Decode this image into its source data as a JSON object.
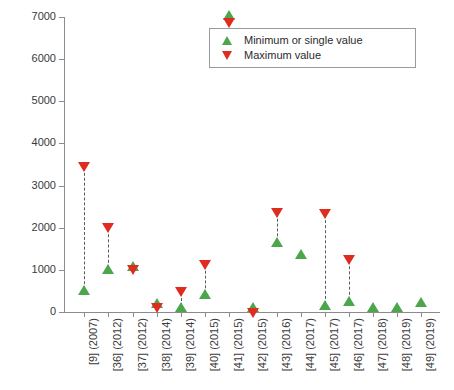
{
  "chart_data": {
    "type": "scatter",
    "title": "",
    "xlabel": "",
    "ylabel": "Profit (£/year)",
    "ylim": [
      0,
      7000
    ],
    "yticks": [
      0,
      1000,
      2000,
      3000,
      4000,
      5000,
      6000,
      7000
    ],
    "ytick_labels": [
      "0",
      "1000",
      "2000",
      "3000",
      "4000",
      "5000",
      "6000",
      "7000"
    ],
    "grid": false,
    "legend_position": "top-right",
    "legend": [
      {
        "label": "Minimum or single value",
        "marker": "triangle-up",
        "color": "#4ca64c"
      },
      {
        "label": "Maximum value",
        "marker": "triangle-down",
        "color": "#e02b20"
      }
    ],
    "categories": [
      "[9] (2007)",
      "[36] (2012)",
      "[37] (2012)",
      "[38] (2014)",
      "[39] (2014)",
      "[40] (2015)",
      "[41] (2015)",
      "[42] (2015)",
      "[43] (2016)",
      "[44] (2017)",
      "[45] (2017)",
      "[46] (2017)",
      "[47] (2018)",
      "[48] (2019)",
      "[49] (2019)"
    ],
    "series": [
      {
        "name": "Minimum or single value",
        "values": [
          430,
          920,
          1000,
          110,
          30,
          340,
          6950,
          20,
          1570,
          1290,
          60,
          170,
          20,
          15,
          140
        ]
      },
      {
        "name": "Maximum value",
        "values": [
          3530,
          2080,
          1080,
          200,
          580,
          1210,
          6950,
          60,
          2450,
          null,
          2420,
          1320,
          null,
          null,
          null
        ]
      }
    ],
    "points": [
      {
        "category": "[9] (2007)",
        "min": 430,
        "max": 3530
      },
      {
        "category": "[36] (2012)",
        "min": 920,
        "max": 2080
      },
      {
        "category": "[37] (2012)",
        "min": 1000,
        "max": 1080
      },
      {
        "category": "[38] (2014)",
        "min": 110,
        "max": 200
      },
      {
        "category": "[39] (2014)",
        "min": 30,
        "max": 580
      },
      {
        "category": "[40] (2015)",
        "min": 340,
        "max": 1210
      },
      {
        "category": "[41] (2015)",
        "min": 6950,
        "max": 6950
      },
      {
        "category": "[42] (2015)",
        "min": 20,
        "max": 60
      },
      {
        "category": "[43] (2016)",
        "min": 1570,
        "max": 2450
      },
      {
        "category": "[44] (2017)",
        "min": 1290,
        "max": null
      },
      {
        "category": "[45] (2017)",
        "min": 60,
        "max": 2420
      },
      {
        "category": "[46] (2017)",
        "min": 170,
        "max": 1320
      },
      {
        "category": "[47] (2018)",
        "min": 20,
        "max": null
      },
      {
        "category": "[48] (2019)",
        "min": 15,
        "max": null
      },
      {
        "category": "[49] (2019)",
        "min": 140,
        "max": null
      }
    ],
    "colors": {
      "minimum": "#4ca64c",
      "maximum": "#e02b20",
      "axis": "#8c8c8c",
      "connector": "#5a5a5a",
      "background": "#ffffff"
    }
  }
}
